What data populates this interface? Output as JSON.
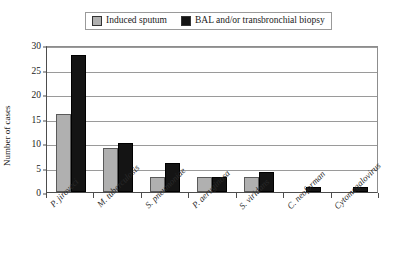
{
  "chart_data": {
    "type": "bar",
    "title": "",
    "subtitle": "",
    "xlabel": "",
    "ylabel": "Number of cases",
    "ylim": [
      0,
      30
    ],
    "yticks": [
      0,
      5,
      10,
      15,
      20,
      25,
      30
    ],
    "grid": true,
    "legend_position": "top",
    "categories": [
      "P. jiroveci",
      "M. tuberculosis",
      "S. pneumoniae",
      "P. aeruginosa",
      "S. viridans",
      "C. neoforman",
      "Cytomegalovirus"
    ],
    "series": [
      {
        "name": "Induced sputum",
        "color": "#b0b0b0",
        "values": [
          16,
          9,
          3,
          3,
          3,
          0,
          0
        ]
      },
      {
        "name": "BAL and/or transbronchial biopsy",
        "color": "#141414",
        "values": [
          28,
          10,
          6,
          3,
          4,
          1,
          1
        ]
      }
    ]
  },
  "legend": {
    "items": [
      {
        "label": "Induced sputum",
        "color": "#b0b0b0"
      },
      {
        "label": "BAL and/or transbronchial biopsy",
        "color": "#141414"
      }
    ]
  },
  "axes": {
    "y_title": "Number of cases",
    "y_tick_labels": [
      "0",
      "5",
      "10",
      "15",
      "20",
      "25",
      "30"
    ]
  }
}
